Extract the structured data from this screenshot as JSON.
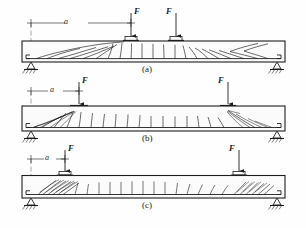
{
  "figure": {
    "type": "engineering-diagram",
    "stroke_color": "#1d1d1d",
    "background_color": "#fefefe",
    "beam_fill": "#fbfbfb"
  },
  "panels": [
    {
      "id": "a",
      "label": "(a)",
      "dimension_label": "a",
      "loads": [
        {
          "label": "F",
          "name": "left-load"
        },
        {
          "label": "F",
          "name": "right-load"
        }
      ],
      "supports": [
        {
          "name": "pin-support",
          "side": "left"
        },
        {
          "name": "roller-support",
          "side": "right"
        }
      ],
      "crack_pattern": "flexural - vertical cracks at midspan with long inclined cracks toward supports"
    },
    {
      "id": "b",
      "label": "(b)",
      "dimension_label": "a",
      "loads": [
        {
          "label": "F",
          "name": "left-load"
        },
        {
          "label": "F",
          "name": "right-load"
        }
      ],
      "supports": [
        {
          "name": "pin-support",
          "side": "left"
        },
        {
          "name": "roller-support",
          "side": "right"
        }
      ],
      "crack_pattern": "shear-compression - diagonal cracks radiating from load points to supports"
    },
    {
      "id": "c",
      "label": "(c)",
      "dimension_label": "a",
      "loads": [
        {
          "label": "F",
          "name": "left-load"
        },
        {
          "label": "F",
          "name": "right-load"
        }
      ],
      "supports": [
        {
          "name": "pin-support",
          "side": "left"
        },
        {
          "name": "roller-support",
          "side": "right"
        }
      ],
      "crack_pattern": "deep beam strut - bundle of parallel inclined cracks near each support"
    }
  ]
}
